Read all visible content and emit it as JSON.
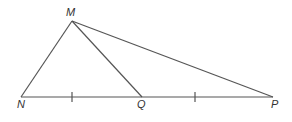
{
  "diagram": {
    "type": "geometry-triangle",
    "stroke_color": "#555555",
    "points": {
      "M": {
        "label": "M",
        "x": 72,
        "y": 21
      },
      "N": {
        "label": "N",
        "x": 21,
        "y": 97
      },
      "Q": {
        "label": "Q",
        "x": 142,
        "y": 97
      },
      "P": {
        "label": "P",
        "x": 273,
        "y": 97
      }
    },
    "segments": [
      "MN",
      "MQ",
      "MP",
      "NP"
    ],
    "tick_marks": [
      {
        "segment": "NQ",
        "x": 72
      },
      {
        "segment": "QP",
        "x": 195
      }
    ],
    "labels": {
      "M": "M",
      "N": "N",
      "Q": "Q",
      "P": "P"
    }
  }
}
